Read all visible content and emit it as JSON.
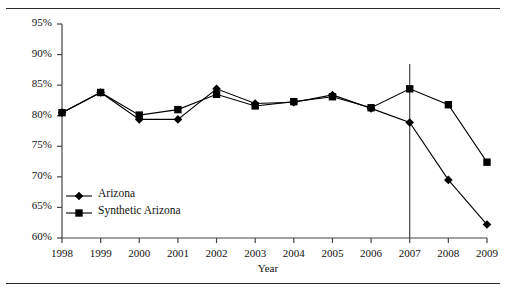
{
  "chart_data": {
    "type": "line",
    "title": "",
    "xlabel": "Year",
    "ylabel": "",
    "categories": [
      "1998",
      "1999",
      "2000",
      "2001",
      "2002",
      "2003",
      "2004",
      "2005",
      "2006",
      "2007",
      "2008",
      "2009"
    ],
    "x": [
      1998,
      1999,
      2000,
      2001,
      2002,
      2003,
      2004,
      2005,
      2006,
      2007,
      2008,
      2009
    ],
    "ylim": [
      60,
      95
    ],
    "ytick_values": [
      60,
      65,
      70,
      75,
      80,
      85,
      90,
      95
    ],
    "ytick_labels": [
      "60%",
      "65%",
      "70%",
      "75%",
      "80%",
      "85%",
      "90%",
      "95%"
    ],
    "grid": false,
    "legend_position": "lower-left-inside",
    "series": [
      {
        "name": "Arizona",
        "marker": "diamond",
        "values": [
          80.5,
          83.8,
          79.4,
          79.4,
          84.4,
          82.0,
          82.2,
          83.4,
          81.2,
          78.9,
          69.5,
          62.2
        ]
      },
      {
        "name": "Synthetic Arizona",
        "marker": "square",
        "values": [
          80.5,
          83.8,
          80.1,
          81.0,
          83.5,
          81.6,
          82.3,
          83.1,
          81.3,
          84.4,
          81.8,
          72.4
        ]
      }
    ],
    "annotations": [
      {
        "type": "vertical-line",
        "x": 2007,
        "label": ""
      }
    ],
    "colors": {
      "line": "#000000",
      "marker": "#000000",
      "axis": "#444444",
      "rule": "#2b2b2b",
      "background": "#ffffff"
    }
  },
  "legend": {
    "items": [
      {
        "label": "Arizona"
      },
      {
        "label": "Synthetic Arizona"
      }
    ]
  },
  "axis": {
    "x_title": "Year"
  }
}
